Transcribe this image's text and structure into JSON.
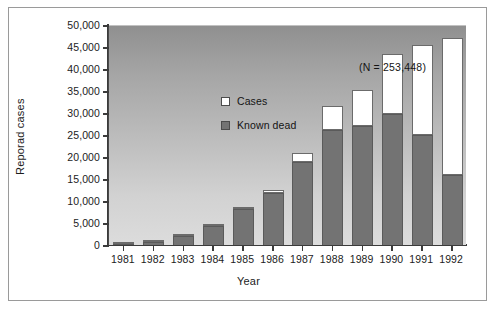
{
  "figure": {
    "annotation": "(N = 253,448)"
  },
  "legend": {
    "items": [
      {
        "label": "Cases",
        "swatch_color": "#ffffff"
      },
      {
        "label": "Known dead",
        "swatch_color": "#737373"
      }
    ]
  },
  "chart_data": {
    "type": "bar",
    "title": "",
    "subtitle": "",
    "annotation": "(N = 253,448)",
    "xlabel": "Year",
    "ylabel": "Reporad cases",
    "stacked": true,
    "grid": false,
    "legend_position": "inside-top-left",
    "ylim": [
      0,
      50000
    ],
    "ytick_values": [
      0,
      5000,
      10000,
      15000,
      20000,
      25000,
      30000,
      35000,
      40000,
      45000,
      50000
    ],
    "ytick_labels": [
      "0",
      "5,000",
      "10,000",
      "15,000",
      "20,000",
      "25,000",
      "30,000",
      "35,000",
      "40,000",
      "45,000",
      "50,000"
    ],
    "categories": [
      "1981",
      "1982",
      "1983",
      "1984",
      "1985",
      "1986",
      "1987",
      "1988",
      "1989",
      "1990",
      "1991",
      "1992"
    ],
    "series": [
      {
        "name": "Known dead",
        "color": "#737373",
        "values": [
          280,
          650,
          2000,
          4400,
          8200,
          11800,
          18800,
          26200,
          27100,
          29800,
          25000,
          15800
        ]
      },
      {
        "name": "Cases",
        "color": "#ffffff",
        "values": [
          20,
          50,
          100,
          100,
          400,
          600,
          2200,
          5500,
          8100,
          13700,
          20500,
          31200
        ]
      }
    ],
    "totals": [
      300,
      700,
      2100,
      4500,
      8600,
      12400,
      21000,
      31700,
      35200,
      43500,
      45500,
      47000
    ]
  }
}
